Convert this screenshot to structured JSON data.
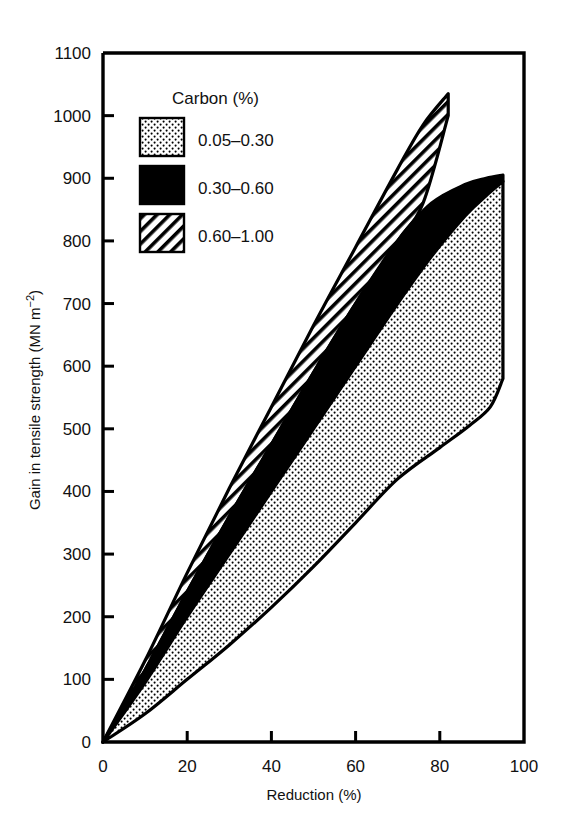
{
  "chart_data": {
    "type": "area",
    "title": "",
    "xlabel": "Reduction (%)",
    "ylabel": "Gain in tensile strength (MN m⁻²)",
    "ylabel_main": "Gain in tensile strength (MN m",
    "ylabel_sup": "−2",
    "ylabel_tail": ")",
    "xlim": [
      0,
      100
    ],
    "ylim": [
      0,
      1100
    ],
    "grid": false,
    "xticks": [
      0,
      20,
      40,
      60,
      80,
      100
    ],
    "xtick_labels": [
      "0",
      "20",
      "40",
      "60",
      "80",
      "100"
    ],
    "yticks": [
      0,
      100,
      200,
      300,
      400,
      500,
      600,
      700,
      800,
      900,
      1000,
      1100
    ],
    "ytick_labels": [
      "0",
      "100",
      "200",
      "300",
      "400",
      "500",
      "600",
      "700",
      "800",
      "900",
      "1000",
      "1100"
    ],
    "legend_title": "Carbon (%)",
    "legend_position": "upper-left-inside",
    "series": [
      {
        "name": "0.05–0.30",
        "fill": "dotted",
        "color": "#000000",
        "upper_bound": [
          {
            "x": 0,
            "y": 0
          },
          {
            "x": 10,
            "y": 95
          },
          {
            "x": 20,
            "y": 200
          },
          {
            "x": 30,
            "y": 300
          },
          {
            "x": 40,
            "y": 400
          },
          {
            "x": 50,
            "y": 500
          },
          {
            "x": 60,
            "y": 600
          },
          {
            "x": 70,
            "y": 700
          },
          {
            "x": 78,
            "y": 775
          },
          {
            "x": 86,
            "y": 840
          },
          {
            "x": 91,
            "y": 872
          },
          {
            "x": 95,
            "y": 895
          }
        ],
        "lower_bound": [
          {
            "x": 0,
            "y": 0
          },
          {
            "x": 10,
            "y": 45
          },
          {
            "x": 20,
            "y": 100
          },
          {
            "x": 30,
            "y": 155
          },
          {
            "x": 40,
            "y": 215
          },
          {
            "x": 50,
            "y": 280
          },
          {
            "x": 60,
            "y": 350
          },
          {
            "x": 70,
            "y": 420
          },
          {
            "x": 80,
            "y": 470
          },
          {
            "x": 87,
            "y": 505
          },
          {
            "x": 92,
            "y": 535
          },
          {
            "x": 95,
            "y": 580
          }
        ]
      },
      {
        "name": "0.30–0.60",
        "fill": "solid-black",
        "color": "#000000",
        "upper_bound": [
          {
            "x": 0,
            "y": 0
          },
          {
            "x": 10,
            "y": 115
          },
          {
            "x": 20,
            "y": 240
          },
          {
            "x": 30,
            "y": 360
          },
          {
            "x": 40,
            "y": 475
          },
          {
            "x": 50,
            "y": 590
          },
          {
            "x": 60,
            "y": 700
          },
          {
            "x": 70,
            "y": 800
          },
          {
            "x": 78,
            "y": 860
          },
          {
            "x": 86,
            "y": 890
          },
          {
            "x": 91,
            "y": 900
          },
          {
            "x": 95,
            "y": 905
          }
        ],
        "lower_bound": [
          {
            "x": 0,
            "y": 0
          },
          {
            "x": 10,
            "y": 95
          },
          {
            "x": 20,
            "y": 200
          },
          {
            "x": 30,
            "y": 300
          },
          {
            "x": 40,
            "y": 400
          },
          {
            "x": 50,
            "y": 500
          },
          {
            "x": 60,
            "y": 600
          },
          {
            "x": 70,
            "y": 700
          },
          {
            "x": 78,
            "y": 775
          },
          {
            "x": 86,
            "y": 840
          },
          {
            "x": 91,
            "y": 872
          },
          {
            "x": 95,
            "y": 895
          }
        ]
      },
      {
        "name": "0.60–1.00",
        "fill": "hatched",
        "color": "#000000",
        "upper_bound": [
          {
            "x": 0,
            "y": 0
          },
          {
            "x": 10,
            "y": 130
          },
          {
            "x": 20,
            "y": 270
          },
          {
            "x": 30,
            "y": 405
          },
          {
            "x": 40,
            "y": 535
          },
          {
            "x": 50,
            "y": 665
          },
          {
            "x": 60,
            "y": 790
          },
          {
            "x": 70,
            "y": 915
          },
          {
            "x": 76,
            "y": 985
          },
          {
            "x": 82,
            "y": 1035
          }
        ],
        "lower_bound": [
          {
            "x": 0,
            "y": 0
          },
          {
            "x": 10,
            "y": 115
          },
          {
            "x": 20,
            "y": 240
          },
          {
            "x": 30,
            "y": 360
          },
          {
            "x": 40,
            "y": 475
          },
          {
            "x": 50,
            "y": 590
          },
          {
            "x": 60,
            "y": 700
          },
          {
            "x": 70,
            "y": 800
          },
          {
            "x": 76,
            "y": 860
          },
          {
            "x": 82,
            "y": 1000
          }
        ]
      }
    ]
  },
  "legend": {
    "title": "Carbon (%)",
    "entries": [
      {
        "label": "0.05–0.30",
        "swatch": "dotted"
      },
      {
        "label": "0.30–0.60",
        "swatch": "solid-black"
      },
      {
        "label": "0.60–1.00",
        "swatch": "hatched"
      }
    ]
  }
}
